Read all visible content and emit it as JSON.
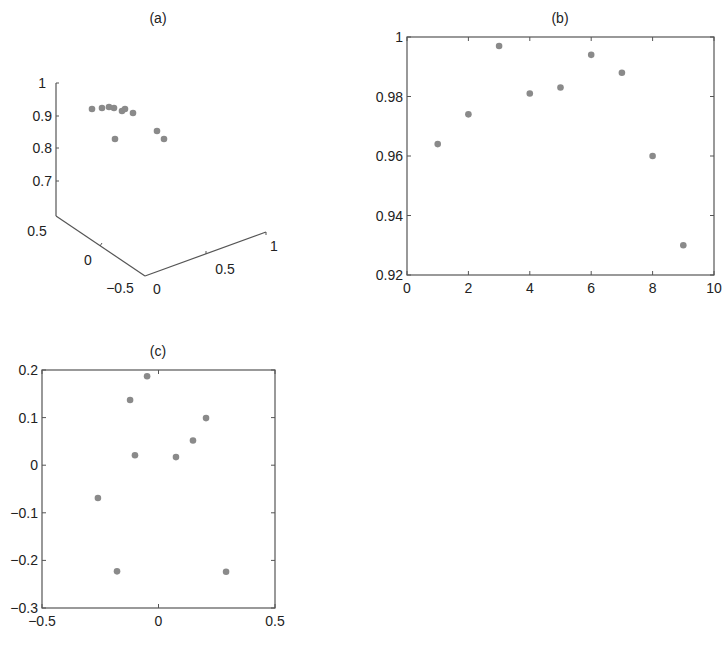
{
  "chart_data": [
    {
      "id": "a",
      "type": "scatter",
      "projection": "3d",
      "title": "(a)",
      "zlabel_ticks": [
        "1",
        "0.9",
        "0.8",
        "0.7"
      ],
      "x_ticks": [
        "0.5",
        "0",
        "-0.5"
      ],
      "y_ticks": [
        "0",
        "0.5",
        "1"
      ],
      "zlim": [
        0.6,
        1
      ],
      "points_z_estimated": [
        0.92,
        0.925,
        0.928,
        0.925,
        0.915,
        0.925,
        0.91,
        0.83,
        0.85,
        0.83
      ],
      "points_px": [
        {
          "x": 92,
          "y": 109
        },
        {
          "x": 102,
          "y": 108
        },
        {
          "x": 109,
          "y": 107
        },
        {
          "x": 114,
          "y": 108
        },
        {
          "x": 122,
          "y": 111
        },
        {
          "x": 125,
          "y": 109
        },
        {
          "x": 133,
          "y": 113
        },
        {
          "x": 115,
          "y": 139
        },
        {
          "x": 157,
          "y": 131
        },
        {
          "x": 164,
          "y": 139
        }
      ]
    },
    {
      "id": "b",
      "type": "scatter",
      "title": "(b)",
      "xlabel": "",
      "ylabel": "",
      "xlim": [
        0,
        10
      ],
      "ylim": [
        0.92,
        1
      ],
      "x_ticks": [
        "0",
        "2",
        "4",
        "6",
        "8",
        "10"
      ],
      "y_ticks": [
        "0.92",
        "0.94",
        "0.96",
        "0.98",
        "1"
      ],
      "x": [
        1,
        2,
        3,
        4,
        5,
        6,
        7,
        8,
        9
      ],
      "y": [
        0.964,
        0.974,
        0.997,
        0.981,
        0.983,
        0.994,
        0.988,
        0.96,
        0.93
      ]
    },
    {
      "id": "c",
      "type": "scatter",
      "title": "(c)",
      "xlabel": "",
      "ylabel": "",
      "xlim": [
        -0.5,
        0.5
      ],
      "ylim": [
        -0.3,
        0.2
      ],
      "x_ticks": [
        "-0.5",
        "0",
        "0.5"
      ],
      "y_ticks": [
        "-0.3",
        "-0.2",
        "-0.1",
        "0",
        "0.1",
        "0.2"
      ],
      "x": [
        -0.049,
        -0.122,
        0.204,
        0.148,
        -0.101,
        0.075,
        -0.26,
        -0.178,
        0.29
      ],
      "y": [
        0.187,
        0.137,
        0.099,
        0.052,
        0.021,
        0.017,
        -0.069,
        -0.223,
        -0.224
      ]
    }
  ],
  "style": {
    "point_color": "#8a8a8a",
    "axis_color": "#555555"
  }
}
